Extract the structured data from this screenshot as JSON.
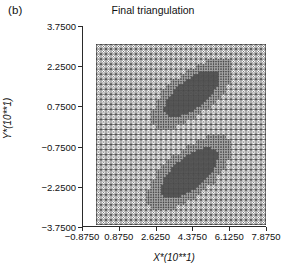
{
  "figure": {
    "panel_label": "(b)",
    "title": "Final triangulation"
  },
  "chart_data": {
    "type": "mesh",
    "title": "Final triangulation",
    "panel": "(b)",
    "xlabel": "X*(10**1)",
    "ylabel": "Y*(10**1)",
    "xlim": [
      -0.875,
      7.875
    ],
    "ylim": [
      -3.75,
      3.75
    ],
    "xticks": [
      -0.875,
      0.875,
      2.625,
      4.375,
      6.125,
      7.875
    ],
    "xtick_labels": [
      "−0.8750",
      "0.8750",
      "2.6250",
      "4.3750",
      "6.1250",
      "7.8750"
    ],
    "yticks": [
      3.75,
      2.25,
      0.75,
      -0.75,
      -2.25,
      -3.75
    ],
    "ytick_labels": [
      "3.7500",
      "2.2500",
      "0.7500",
      "−0.7500",
      "−2.2500",
      "−3.7500"
    ],
    "grid": false,
    "legend": null,
    "mesh_domain": {
      "x_min": 0.0,
      "x_max": 7.0,
      "y_min": -3.0,
      "y_max": 3.0
    },
    "base_grid_cells_x": 34,
    "base_grid_cells_y": 36,
    "triangulation": "criss-cross quadrilateral cells split by both diagonals",
    "refined_regions": [
      {
        "name": "upper-refinement-blob",
        "center_x": 3.95,
        "center_y": 1.35,
        "semi_major": 0.95,
        "semi_minor": 0.33,
        "angle_deg": -38,
        "density": "high"
      },
      {
        "name": "lower-refinement-blob",
        "center_x": 3.85,
        "center_y": -1.28,
        "semi_major": 1.0,
        "semi_minor": 0.36,
        "angle_deg": -40,
        "density": "high"
      }
    ],
    "colors": {
      "mesh_line": "#333333",
      "axis": "#2a2a2a",
      "text": "#111111",
      "background": "#ffffff"
    }
  }
}
